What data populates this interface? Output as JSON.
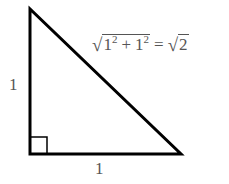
{
  "diagram": {
    "type": "right-triangle",
    "vertices": {
      "top": [
        30,
        9
      ],
      "right_angle": [
        30,
        154
      ],
      "bottom_right": [
        181,
        154
      ]
    },
    "right_angle_marker_size": 17,
    "line_color": "#000000",
    "label_color": "#555555",
    "labels": {
      "left_leg": "1",
      "bottom_leg": "1"
    },
    "formula": {
      "radicand_a": "1",
      "exp_a": "2",
      "plus": "+",
      "radicand_b": "1",
      "exp_b": "2",
      "equals": "=",
      "result_radicand": "2",
      "text": "√(1² + 1²) = √2"
    }
  }
}
